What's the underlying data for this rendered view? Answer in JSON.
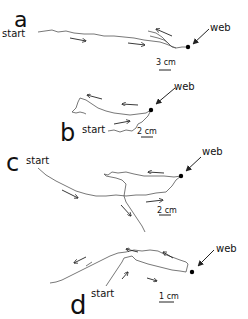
{
  "figure": {
    "panels": [
      {
        "id": "a",
        "letter": "a",
        "letter_pos": [
          14,
          27
        ],
        "letter_size": 22,
        "start_label": "start",
        "start_pos": [
          2,
          37
        ],
        "web_label": "web",
        "web_label_pos": [
          210,
          31
        ],
        "web_dot": [
          188,
          47
        ],
        "web_arrow": [
          [
            209,
            29
          ],
          [
            193,
            44
          ]
        ],
        "scale_label": "3 cm",
        "scale_label_pos": [
          156,
          65
        ],
        "scale_bar": [
          [
            159,
            70
          ],
          [
            171,
            70
          ]
        ],
        "tracks": [
          "M38,32 L45,31 L52,30 L58,32 L66,31 L74,33 L84,34 L94,34 L104,36 L114,36 L124,37 L134,38 L144,40 L152,41 L160,42 L166,44 L171,46 L176,48 L182,47 L186,47",
          "M150,36 L158,38 L164,40 L168,43 L172,47 L176,48",
          "M148,31 L156,33 L162,37 L167,42 L172,47"
        ],
        "direction_arrows": [
          [
            [
              70,
              38
            ],
            [
              86,
              41
            ]
          ],
          [
            [
              128,
              43
            ],
            [
              145,
              45
            ]
          ],
          [
            [
              172,
              36
            ],
            [
              156,
              29
            ]
          ]
        ]
      },
      {
        "id": "b",
        "letter": "b",
        "letter_pos": [
          60,
          141
        ],
        "letter_size": 24,
        "start_label": "start",
        "start_pos": [
          82,
          133
        ],
        "web_label": "web",
        "web_label_pos": [
          174,
          90
        ],
        "web_dot": [
          151,
          110
        ],
        "web_arrow": [
          [
            175,
            88
          ],
          [
            156,
            104
          ]
        ],
        "scale_label": "2 cm",
        "scale_label_pos": [
          137,
          134
        ],
        "scale_bar": [
          [
            141,
            137
          ],
          [
            153,
            137
          ]
        ],
        "tracks": [
          "M108,131 L114,130 L120,132 L126,130 L132,131 L136,128 L138,124 L142,122 L145,119 L148,116 L151,110",
          "M151,110 L146,113 L138,114 L130,115 L122,114 L114,113 L106,111 L98,108 L92,104 L86,100 L80,98 L78,102 L76,108 L72,112",
          "M72,112 L76,113 L80,112 L84,113 L86,114"
        ],
        "direction_arrows": [
          [
            [
              114,
              124
            ],
            [
              130,
              121
            ]
          ],
          [
            [
              102,
              99
            ],
            [
              87,
              95
            ]
          ],
          [
            [
              138,
              105
            ],
            [
              122,
              104
            ]
          ]
        ]
      },
      {
        "id": "c",
        "letter": "c",
        "letter_pos": [
          6,
          171
        ],
        "letter_size": 24,
        "start_label": "start",
        "start_pos": [
          26,
          164
        ],
        "web_label": "web",
        "web_label_pos": [
          202,
          155
        ],
        "web_dot": [
          181,
          176
        ],
        "web_arrow": [
          [
            201,
            157
          ],
          [
            186,
            171
          ]
        ],
        "scale_label": "2 cm",
        "scale_label_pos": [
          157,
          213
        ],
        "scale_bar": [
          [
            159,
            215
          ],
          [
            171,
            215
          ]
        ],
        "tracks": [
          "M38,168 L46,175 L56,181 L66,186 L76,191 L86,194 L96,196 L106,196 L116,195 L126,196 L136,195 L146,195 L156,193 L166,192 L172,186 L176,180 L181,176",
          "M181,176 L174,177 L164,176 L154,176 L144,176 L134,174 L126,172 L118,173 L112,172 L108,175 L104,174 L106,176 L116,178 L122,180 L126,184 L125,190 L124,196 L126,202 L130,208 L134,214 L138,220 L142,226 L145,232"
        ],
        "direction_arrows": [
          [
            [
              62,
              190
            ],
            [
              78,
              198
            ]
          ],
          [
            [
              146,
              202
            ],
            [
              163,
              200
            ]
          ],
          [
            [
              164,
              173
            ],
            [
              148,
              172
            ]
          ],
          [
            [
              121,
              205
            ],
            [
              131,
              216
            ]
          ]
        ]
      },
      {
        "id": "d",
        "letter": "d",
        "letter_pos": [
          70,
          314
        ],
        "letter_size": 26,
        "start_label": "start",
        "start_pos": [
          91,
          297
        ],
        "web_label": "web",
        "web_label_pos": [
          216,
          252
        ],
        "web_dot": [
          192,
          272
        ],
        "web_arrow": [
          [
            214,
            250
          ],
          [
            198,
            266
          ]
        ],
        "scale_label": "1 cm",
        "scale_label_pos": [
          159,
          299
        ],
        "scale_bar": [
          [
            159,
            302
          ],
          [
            174,
            302
          ]
        ],
        "tracks": [
          "M106,286 L110,280 L114,274 L118,268 L122,262 L124,258 L128,257 L132,256 L136,260 L142,262 L148,264 L156,266 L164,268 L172,270 L180,271 L186,272 L188,264 L186,262 L180,260 L172,257 L164,254 L158,251 L150,250 L142,251 L134,250 L126,252 L118,253 L110,256 L102,260 L94,264 L86,268 L78,272 L70,276 L62,280 L56,282 L50,283",
          "M86,266 L92,262"
        ],
        "direction_arrows": [
          [
            [
              122,
              279
            ],
            [
              128,
              272
            ]
          ],
          [
            [
              147,
              278
            ],
            [
              157,
              281
            ]
          ],
          [
            [
              138,
              252
            ],
            [
              126,
              249
            ]
          ],
          [
            [
              173,
              258
            ],
            [
              163,
              252
            ]
          ],
          [
            [
              86,
              257
            ],
            [
              74,
              263
            ]
          ]
        ]
      }
    ]
  }
}
